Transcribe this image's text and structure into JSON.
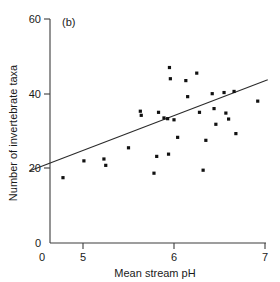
{
  "panel": {
    "label": "(b)"
  },
  "chart_data": {
    "type": "scatter",
    "title": "",
    "xlabel": "Mean stream pH",
    "ylabel": "Number of invertebrate taxa",
    "xlim": [
      4.33,
      7.0
    ],
    "ylim": [
      0,
      60
    ],
    "xticks": [
      0,
      5,
      6,
      7
    ],
    "xticklabels": [
      "0",
      "5",
      "6",
      "7"
    ],
    "yticks": [
      0,
      20,
      40,
      60
    ],
    "yticklabels": [
      "0",
      "20",
      "40",
      "60"
    ],
    "grid": false,
    "legend": null,
    "axis_break_x": true,
    "points": [
      {
        "x": 4.78,
        "y": 17.5
      },
      {
        "x": 5.01,
        "y": 22.0
      },
      {
        "x": 5.23,
        "y": 22.5
      },
      {
        "x": 5.25,
        "y": 20.8
      },
      {
        "x": 5.5,
        "y": 25.5
      },
      {
        "x": 5.63,
        "y": 35.3
      },
      {
        "x": 5.64,
        "y": 34.2
      },
      {
        "x": 5.78,
        "y": 18.7
      },
      {
        "x": 5.81,
        "y": 23.2
      },
      {
        "x": 5.83,
        "y": 35.0
      },
      {
        "x": 5.89,
        "y": 33.5
      },
      {
        "x": 5.93,
        "y": 33.3
      },
      {
        "x": 5.94,
        "y": 23.8
      },
      {
        "x": 5.95,
        "y": 47.0
      },
      {
        "x": 5.96,
        "y": 44.0
      },
      {
        "x": 6.0,
        "y": 33.0
      },
      {
        "x": 6.04,
        "y": 28.3
      },
      {
        "x": 6.13,
        "y": 43.5
      },
      {
        "x": 6.15,
        "y": 39.2
      },
      {
        "x": 6.25,
        "y": 45.5
      },
      {
        "x": 6.28,
        "y": 35.0
      },
      {
        "x": 6.32,
        "y": 19.5
      },
      {
        "x": 6.35,
        "y": 27.5
      },
      {
        "x": 6.42,
        "y": 40.0
      },
      {
        "x": 6.44,
        "y": 36.0
      },
      {
        "x": 6.46,
        "y": 31.8
      },
      {
        "x": 6.55,
        "y": 40.3
      },
      {
        "x": 6.57,
        "y": 34.8
      },
      {
        "x": 6.6,
        "y": 33.2
      },
      {
        "x": 6.66,
        "y": 40.6
      },
      {
        "x": 6.68,
        "y": 29.3
      },
      {
        "x": 6.92,
        "y": 38.0
      }
    ],
    "fit_line": {
      "x_start": 4.41,
      "y_start": 19.3,
      "x_end": 7.03,
      "y_end": 43.7
    }
  }
}
